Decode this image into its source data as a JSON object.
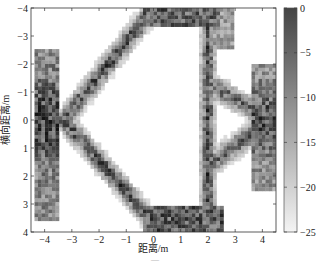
{
  "chart_data": {
    "type": "heatmap",
    "title": "",
    "xlabel": "距离/m",
    "ylabel": "横向距离/m",
    "xlim": [
      -4.5,
      4.5
    ],
    "ylim": [
      -4,
      4
    ],
    "y_direction": "reversed (−4 at top, 4 at bottom)",
    "xticks": [
      -4,
      -3,
      -2,
      -1,
      0,
      1,
      2,
      3,
      4
    ],
    "yticks": [
      -4,
      -3,
      -2,
      -1,
      0,
      1,
      2,
      3,
      4
    ],
    "colorbar": {
      "ticks": [
        0,
        -5,
        -10,
        -15,
        -20,
        -25
      ],
      "range": [
        -25,
        0
      ],
      "colormap": "gray (dark = 0 dB, white = -25 dB)"
    },
    "grid": false,
    "features": [
      {
        "name": "left vertical band",
        "x_range": [
          -4.3,
          -3.6
        ],
        "y_range": [
          -2.5,
          3.5
        ],
        "intensity": "strong around y=0"
      },
      {
        "name": "upper-left diagonal",
        "from": [
          -3.3,
          0
        ],
        "to": [
          0,
          -4
        ],
        "intensity": "medium"
      },
      {
        "name": "lower-left diagonal",
        "from": [
          -3.3,
          0
        ],
        "to": [
          0,
          4
        ],
        "intensity": "medium"
      },
      {
        "name": "top horizontal edge",
        "x_range": [
          -0.3,
          2.2
        ],
        "y": -4,
        "intensity": "strong"
      },
      {
        "name": "bottom horizontal edge",
        "x_range": [
          -0.3,
          2.5
        ],
        "y": 4,
        "intensity": "strong"
      },
      {
        "name": "vertical line at x≈2",
        "x": 2.0,
        "y_range": [
          -4,
          4
        ],
        "intensity": "strong"
      },
      {
        "name": "right diagonals converging",
        "from": [
          2.2,
          -1
        ],
        "to": [
          4.3,
          0
        ],
        "intensity": "medium"
      },
      {
        "name": "right edge band",
        "x_range": [
          3.6,
          4.5
        ],
        "y_range": [
          -2,
          2.5
        ],
        "intensity": "strong"
      }
    ]
  },
  "axes": {
    "xlabel": "距离/m",
    "ylabel": "横向距离/m",
    "xticks": [
      "-4",
      "-3",
      "-2",
      "-1",
      "0",
      "1",
      "2",
      "3",
      "4"
    ],
    "yticks": [
      "-4",
      "-3",
      "-2",
      "-1",
      "0",
      "1",
      "2",
      "3",
      "4"
    ]
  },
  "colorbar": {
    "ticks": [
      "0",
      "-5",
      "-10",
      "-15",
      "-20",
      "-25"
    ]
  }
}
